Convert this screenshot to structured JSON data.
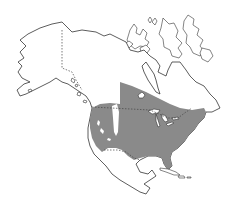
{
  "map": {
    "title": "",
    "region": "North America",
    "range_color": "#8a8a8a",
    "land_color": "#ffffff",
    "outline_color": "#333333",
    "features": [
      {
        "name": "Alaska",
        "type": "land"
      },
      {
        "name": "Canada",
        "type": "land"
      },
      {
        "name": "Arctic Archipelago",
        "type": "land"
      },
      {
        "name": "United States",
        "type": "land"
      },
      {
        "name": "Mexico",
        "type": "land"
      },
      {
        "name": "Central America",
        "type": "land"
      },
      {
        "name": "Caribbean islands",
        "type": "land"
      },
      {
        "name": "Great Lakes",
        "type": "water"
      },
      {
        "name": "Shaded distribution range",
        "type": "range"
      }
    ]
  }
}
